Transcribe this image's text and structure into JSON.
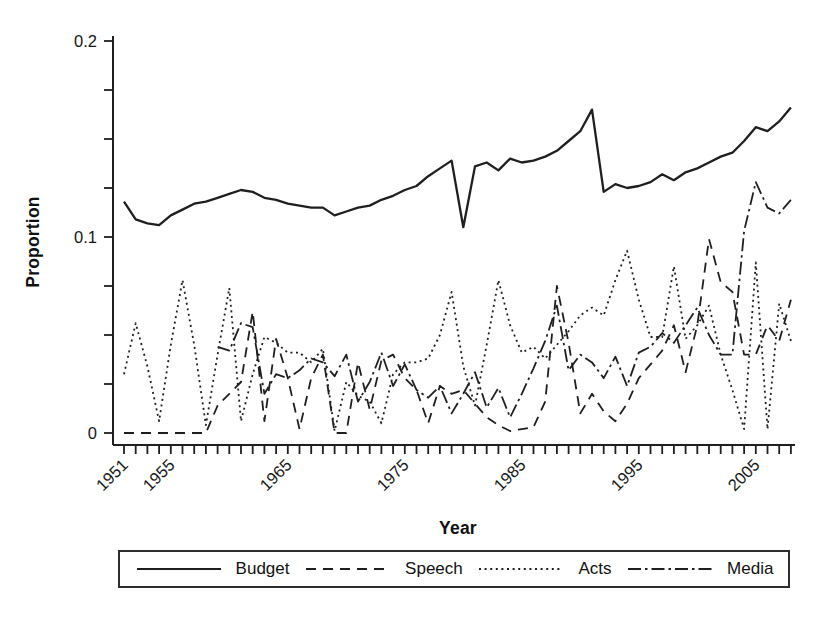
{
  "figure": {
    "background": "#ffffff",
    "ink_color": "#1f1f1f"
  },
  "axes": {
    "y_title": "Proportion",
    "x_title": "Year",
    "y_tick_labels": [
      {
        "label": "0",
        "value": 0
      },
      {
        "label": "0.1",
        "value": 0.1
      },
      {
        "label": "0.2",
        "value": 0.2
      }
    ],
    "y_minor_tick_step": 0.025,
    "x_labeled_ticks": [
      {
        "label": "1951",
        "year": 1951
      },
      {
        "label": "1955",
        "year": 1955
      },
      {
        "label": "1965",
        "year": 1965
      },
      {
        "label": "1975",
        "year": 1975
      },
      {
        "label": "1985",
        "year": 1985
      },
      {
        "label": "1995",
        "year": 1995
      },
      {
        "label": "2005",
        "year": 2005
      }
    ],
    "x_minor_tick_step_years": 1
  },
  "legend": {
    "items": [
      {
        "label": "Budget",
        "pattern": "solid"
      },
      {
        "label": "Speech",
        "pattern": "dashed"
      },
      {
        "label": "Acts",
        "pattern": "dotted"
      },
      {
        "label": "Media",
        "pattern": "dash-dot"
      }
    ]
  },
  "chart_data": {
    "type": "line",
    "title": "",
    "xlabel": "Year",
    "ylabel": "Proportion",
    "xlim": [
      1951,
      2008
    ],
    "ylim": [
      0,
      0.2
    ],
    "grid": false,
    "legend_position": "bottom",
    "x": [
      1951,
      1952,
      1953,
      1954,
      1955,
      1956,
      1957,
      1958,
      1959,
      1960,
      1961,
      1962,
      1963,
      1964,
      1965,
      1966,
      1967,
      1968,
      1969,
      1970,
      1971,
      1972,
      1973,
      1974,
      1975,
      1976,
      1977,
      1978,
      1979,
      1980,
      1981,
      1982,
      1983,
      1984,
      1985,
      1986,
      1987,
      1988,
      1989,
      1990,
      1991,
      1992,
      1993,
      1994,
      1995,
      1996,
      1997,
      1998,
      1999,
      2000,
      2001,
      2002,
      2003,
      2004,
      2005,
      2006,
      2007,
      2008
    ],
    "series": [
      {
        "name": "Budget",
        "line_style": "solid",
        "stroke_width": 2.3,
        "values": [
          0.118,
          0.109,
          0.107,
          0.106,
          0.111,
          0.114,
          0.117,
          0.118,
          0.12,
          0.122,
          0.124,
          0.123,
          0.12,
          0.119,
          0.117,
          0.116,
          0.115,
          0.115,
          0.111,
          0.113,
          0.115,
          0.116,
          0.119,
          0.121,
          0.124,
          0.126,
          0.131,
          0.135,
          0.139,
          0.105,
          0.136,
          0.138,
          0.134,
          0.14,
          0.138,
          0.139,
          0.141,
          0.144,
          0.149,
          0.154,
          0.165,
          0.123,
          0.127,
          0.125,
          0.126,
          0.128,
          0.132,
          0.129,
          0.133,
          0.135,
          0.138,
          0.141,
          0.143,
          0.149,
          0.156,
          0.154,
          0.159,
          0.166
        ]
      },
      {
        "name": "Speech",
        "line_style": "dashed",
        "stroke_width": 1.8,
        "values": [
          0,
          0,
          0,
          0,
          0,
          0,
          0,
          0,
          0.014,
          0.02,
          0.026,
          0.062,
          0.006,
          0.048,
          0.028,
          0.002,
          0.028,
          0.04,
          0,
          0,
          0.036,
          0.012,
          0.037,
          0.04,
          0.028,
          0.022,
          0.005,
          0.024,
          0.02,
          0.022,
          0.015,
          0.008,
          0.004,
          0.001,
          0.002,
          0.003,
          0.016,
          0.075,
          0.046,
          0.01,
          0.02,
          0.011,
          0.006,
          0.015,
          0.028,
          0.035,
          0.042,
          0.055,
          0.031,
          0.055,
          0.099,
          0.077,
          0.072,
          0.04,
          0.04,
          0.055,
          0.047,
          0.068
        ]
      },
      {
        "name": "Acts",
        "line_style": "dotted",
        "stroke_width": 1.8,
        "values": [
          0.03,
          0.056,
          0.034,
          0.006,
          0.045,
          0.078,
          0.045,
          0.004,
          0.04,
          0.074,
          0.006,
          0.03,
          0.049,
          0.046,
          0.041,
          0.041,
          0.036,
          0.043,
          0.001,
          0.026,
          0.019,
          0.016,
          0.005,
          0.03,
          0.036,
          0.036,
          0.038,
          0.05,
          0.072,
          0.034,
          0.014,
          0.045,
          0.078,
          0.055,
          0.041,
          0.044,
          0.038,
          0.045,
          0.052,
          0.06,
          0.064,
          0.06,
          0.078,
          0.093,
          0.068,
          0.049,
          0.049,
          0.085,
          0.048,
          0.055,
          0.065,
          0.04,
          0.022,
          0.002,
          0.087,
          0.002,
          0.066,
          0.047
        ]
      },
      {
        "name": "Media",
        "line_style": "dash-dot",
        "stroke_width": 1.8,
        "values": [
          null,
          null,
          null,
          null,
          null,
          null,
          null,
          null,
          0.044,
          0.042,
          0.056,
          0.054,
          0.02,
          0.03,
          0.028,
          0.032,
          0.038,
          0.036,
          0.029,
          0.04,
          0.016,
          0.026,
          0.041,
          0.024,
          0.035,
          0.022,
          0.018,
          0.024,
          0.01,
          0.02,
          0.031,
          0.013,
          0.023,
          0.008,
          0.02,
          0.033,
          0.047,
          0.065,
          0.032,
          0.04,
          0.036,
          0.028,
          0.039,
          0.024,
          0.041,
          0.044,
          0.051,
          0.046,
          0.055,
          0.064,
          0.05,
          0.04,
          0.04,
          0.103,
          0.128,
          0.115,
          0.112,
          0.119
        ]
      }
    ]
  }
}
